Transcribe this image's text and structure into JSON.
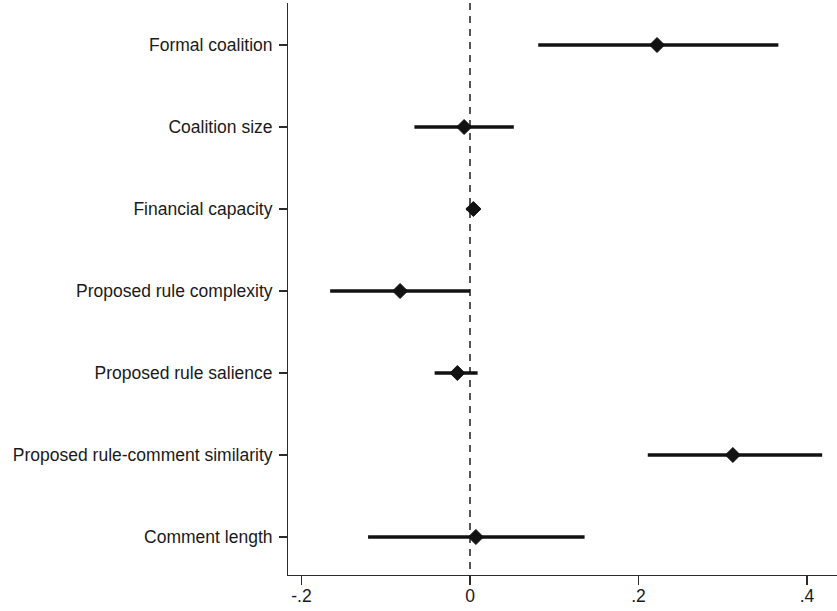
{
  "chart_data": {
    "type": "scatter",
    "subtype": "coefficient-forest-plot",
    "title": "",
    "subtitle": "",
    "xlabel": "",
    "ylabel": "",
    "xlim": [
      -0.255,
      0.435
    ],
    "xticks": [
      -0.2,
      0,
      0.2,
      0.4
    ],
    "xtick_labels": [
      "-.2",
      "0",
      ".2",
      ".4"
    ],
    "grid": false,
    "legend": null,
    "reference_line": {
      "value": 0,
      "style": "dashed",
      "color": "#555555"
    },
    "marker": "diamond",
    "categories": [
      "Formal coalition",
      "Coalition size",
      "Financial capacity",
      "Proposed rule complexity",
      "Proposed rule salience",
      "Proposed rule-comment similarity",
      "Comment length"
    ],
    "points": [
      {
        "label": "Formal coalition",
        "estimate": 0.222,
        "ci_low": 0.081,
        "ci_high": 0.366
      },
      {
        "label": "Coalition size",
        "estimate": -0.007,
        "ci_low": -0.066,
        "ci_high": 0.052
      },
      {
        "label": "Financial capacity",
        "estimate": 0.004,
        "ci_low": -0.004,
        "ci_high": 0.012
      },
      {
        "label": "Proposed rule complexity",
        "estimate": -0.083,
        "ci_low": -0.166,
        "ci_high": 0.0
      },
      {
        "label": "Proposed rule salience",
        "estimate": -0.015,
        "ci_low": -0.042,
        "ci_high": 0.009
      },
      {
        "label": "Proposed rule-comment similarity",
        "estimate": 0.312,
        "ci_low": 0.211,
        "ci_high": 0.418
      },
      {
        "label": "Comment length",
        "estimate": 0.007,
        "ci_low": -0.121,
        "ci_high": 0.136
      }
    ],
    "colors": {
      "marker": "#121212",
      "ci_bar": "#121212",
      "axis": "#2b2b2b",
      "reference": "#555555",
      "background": "#ffffff"
    }
  }
}
